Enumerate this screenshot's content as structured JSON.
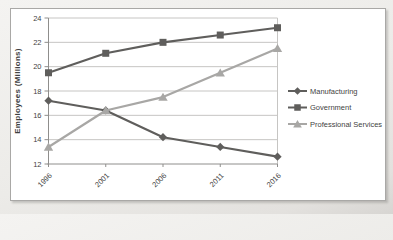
{
  "window": {
    "background": "#ece9e6"
  },
  "chart": {
    "frame_border_color": "#a9a8a6",
    "plot_background": "#ffffff",
    "grid_color": "#c6c5c3",
    "axis_color": "#8f8e8c",
    "text_color": "#3f3f3f"
  },
  "chart_data": {
    "type": "line",
    "title": "",
    "xlabel": "",
    "ylabel": "Employees (Millions)",
    "x": [
      "1996",
      "2001",
      "2006",
      "2011",
      "2016"
    ],
    "ylim": [
      12,
      24
    ],
    "ytick_step": 2,
    "grid": true,
    "legend_position": "right",
    "series": [
      {
        "name": "Manufacturing",
        "marker": "diamond",
        "color": "#5f5e5c",
        "values": [
          17.2,
          16.4,
          14.2,
          13.4,
          12.6
        ]
      },
      {
        "name": "Government",
        "marker": "square",
        "color": "#5f5e5c",
        "values": [
          19.5,
          21.1,
          22.0,
          22.6,
          23.2
        ]
      },
      {
        "name": "Professional Services",
        "marker": "triangle",
        "color": "#a8a7a5",
        "values": [
          13.4,
          16.4,
          17.5,
          19.5,
          21.5
        ]
      }
    ]
  }
}
